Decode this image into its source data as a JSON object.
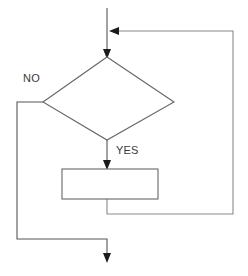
{
  "diagram": {
    "type": "flowchart",
    "background_color": "#ffffff",
    "line_color": "#555555",
    "loop_line_color": "#8a8a8a",
    "shape_stroke_color": "#666666",
    "shape_fill_color": "#ffffff",
    "arrow_color": "#1b1b1b",
    "label_color": "#3a3a3a"
  },
  "labels": {
    "no_branch": "NO",
    "yes_branch": "YES"
  },
  "nodes": {
    "decision": {
      "shape": "diamond",
      "text": "",
      "top": [
        107,
        57
      ],
      "left": [
        43,
        102
      ],
      "right": [
        174,
        102
      ],
      "bottom": [
        107,
        140
      ]
    },
    "process": {
      "shape": "rectangle",
      "text": "",
      "x": 62,
      "y": 169,
      "width": 96,
      "height": 30
    }
  },
  "connectors": {
    "entry": {
      "points": "107,8 107,53",
      "arrow": "down",
      "arrow_tip": [
        107,
        58
      ]
    },
    "feedback_join": {
      "arrow": "left",
      "arrow_tip": [
        110,
        31
      ]
    },
    "yes_path": {
      "points": "107,140 107,164",
      "arrow": "down",
      "arrow_tip": [
        107,
        169
      ]
    },
    "no_path": {
      "points": "43,102 17,102 17,239 107,239 107,257",
      "arrow": "down",
      "arrow_tip": [
        107,
        262
      ]
    },
    "loop_back": {
      "points": "107,199 107,214 233,214 233,31 113,31",
      "arrow": "left"
    }
  }
}
